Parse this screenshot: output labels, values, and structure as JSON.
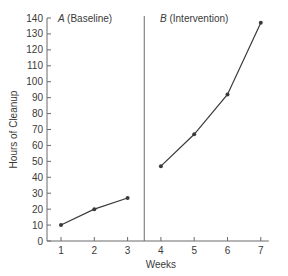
{
  "chart_data": {
    "type": "line",
    "title": "",
    "xlabel": "Weeks",
    "ylabel": "Hours of Cleanup",
    "x": [
      1,
      2,
      3,
      4,
      5,
      6,
      7
    ],
    "ylim": [
      0,
      140
    ],
    "xlim": [
      1,
      7
    ],
    "y_ticks": [
      0,
      10,
      20,
      30,
      40,
      50,
      60,
      70,
      80,
      90,
      100,
      110,
      120,
      130,
      140
    ],
    "x_ticks": [
      1,
      2,
      3,
      4,
      5,
      6,
      7
    ],
    "grid": false,
    "phase_divider_x": 3.5,
    "series": [
      {
        "name": "A (Baseline)",
        "phase_letter": "A",
        "phase_label": "(Baseline)",
        "x": [
          1,
          2,
          3
        ],
        "values": [
          10,
          20,
          27
        ]
      },
      {
        "name": "B (Intervention)",
        "phase_letter": "B",
        "phase_label": "(Intervention)",
        "x": [
          4,
          5,
          6,
          7
        ],
        "values": [
          47,
          67,
          92,
          137
        ]
      }
    ],
    "colors": {
      "line": "#3a3a3a",
      "axis": "#6a6a6a"
    }
  }
}
